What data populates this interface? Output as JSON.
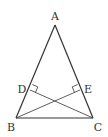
{
  "diagram": {
    "type": "geometry",
    "points": {
      "A": {
        "label": "A",
        "x": 55,
        "y": 25,
        "lx": 55,
        "ly": 20
      },
      "B": {
        "label": "B",
        "x": 16,
        "y": 118,
        "lx": 11,
        "ly": 131
      },
      "C": {
        "label": "C",
        "x": 93,
        "y": 118,
        "lx": 98,
        "ly": 131
      },
      "D": {
        "label": "D",
        "x": 30,
        "y": 90,
        "lx": 22,
        "ly": 93
      },
      "E": {
        "label": "E",
        "x": 80,
        "y": 90,
        "lx": 88,
        "ly": 93
      }
    },
    "segments": [
      "AB",
      "AC",
      "BC",
      "BE",
      "CD"
    ],
    "right_angles": [
      "D",
      "E"
    ],
    "colors": {
      "stroke": "#333333",
      "background": "#ffffff"
    }
  }
}
